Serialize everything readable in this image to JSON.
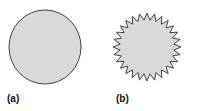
{
  "panels": [
    {
      "label": "(a)",
      "shape": "circle",
      "fill": "#d9d9d9",
      "stroke": "#444444"
    },
    {
      "label": "(b)",
      "shape": "spiky-star",
      "spikes": 28,
      "fill": "#d9d9d9",
      "stroke": "#444444"
    }
  ]
}
